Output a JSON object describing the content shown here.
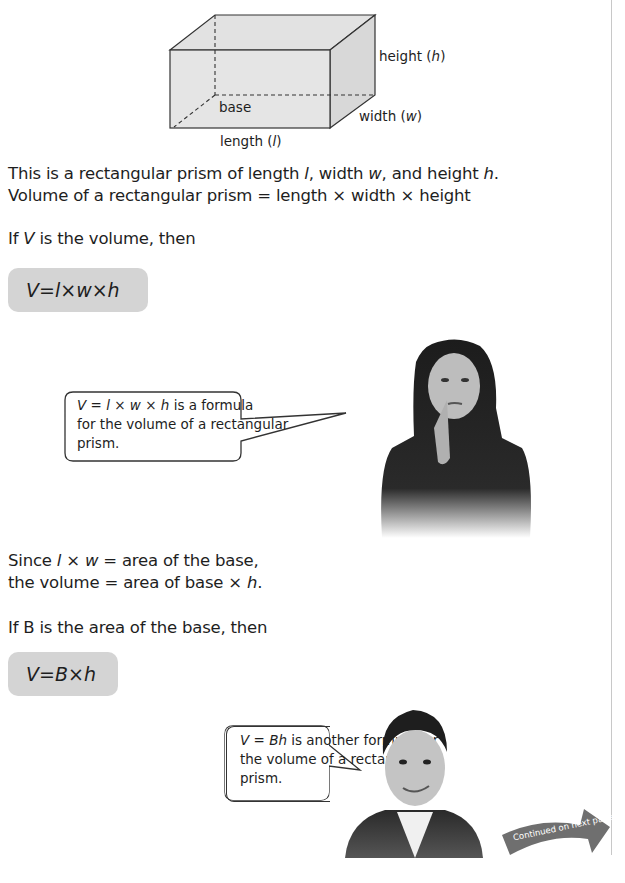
{
  "diagram": {
    "label_height": "height (",
    "label_height_var": "h",
    "label_width": "width (",
    "label_width_var": "w",
    "label_length": "length (",
    "label_length_var": "l",
    "label_base": "base",
    "close_paren": ")"
  },
  "intro": {
    "line1": {
      "a": "This is a rectangular prism of length ",
      "l": "l",
      "b": ", width ",
      "w": "w",
      "c": ", and height ",
      "h": "h",
      "d": "."
    },
    "line2": "Volume of a rectangular prism = length × width × height"
  },
  "if_v": {
    "a": "If ",
    "v": "V",
    "b": " is the volume, then"
  },
  "formula1": {
    "V": "V",
    "eq": " = ",
    "l": "l",
    "x1": " × ",
    "w": "w",
    "x2": " × ",
    "h": "h"
  },
  "bubble1": {
    "formula_V": "V",
    "formula_rest_a": " = ",
    "formula_l": "l",
    "formula_x1": " × ",
    "formula_w": "w",
    "formula_x2": " × ",
    "formula_h": "h",
    "text1": " is a formula",
    "text2": "for the volume of a rectangular",
    "text3": "prism."
  },
  "since": {
    "line1_a": "Since ",
    "line1_l": "l",
    "line1_b": " × ",
    "line1_w": "w",
    "line1_c": " = area of the base,",
    "line2_a": "the volume = area of base × ",
    "line2_h": "h",
    "line2_b": "."
  },
  "if_b": "If B is the area of the base, then",
  "formula2": {
    "V": "V",
    "eq": " = ",
    "B": "B",
    "x": " × ",
    "h": "h"
  },
  "bubble2": {
    "formula_V": "V",
    "formula_eq": " = ",
    "formula_Bh": "Bh",
    "text1": " is another formula for",
    "text2": "the volume of a rectangular",
    "text3": "prism."
  },
  "continued": {
    "label": "Continued on next page",
    "color": "#6f6f6f"
  }
}
